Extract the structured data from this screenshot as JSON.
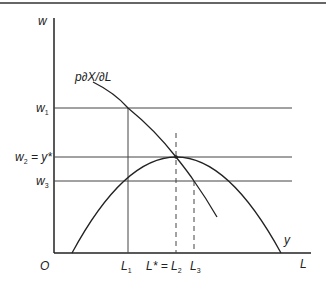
{
  "diagram": {
    "title": "",
    "axes": {
      "y_label": "w",
      "x_label": "L",
      "origin_label": "O"
    },
    "curves": {
      "mvp_label": "p∂X/∂L",
      "y_curve_label": "y"
    },
    "wage_levels": [
      {
        "id": "w1",
        "base": "w",
        "sub": "1",
        "suffix": ""
      },
      {
        "id": "w2",
        "base": "w",
        "sub": "2",
        "suffix": " = y*"
      },
      {
        "id": "w3",
        "base": "w",
        "sub": "3",
        "suffix": ""
      }
    ],
    "labor_levels": [
      {
        "id": "L1",
        "base": "L",
        "sub": "1",
        "prefix": ""
      },
      {
        "id": "L2",
        "base": "L",
        "sub": "2",
        "prefix": "L* = "
      },
      {
        "id": "L3",
        "base": "L",
        "sub": "3",
        "prefix": ""
      }
    ],
    "colors": {
      "line": "#222222",
      "border": "#333333",
      "background": "#ffffff"
    }
  }
}
